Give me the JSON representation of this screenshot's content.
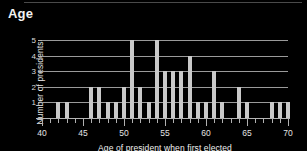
{
  "chart_data": {
    "type": "bar",
    "title": "Age",
    "subtitle": "",
    "xlabel": "Age of president when first elected",
    "ylabel": "Number of presidents",
    "xlim": [
      40,
      70
    ],
    "ylim": [
      0,
      5
    ],
    "grid": true,
    "legend_position": "none",
    "x_tick_labels": [
      "40",
      "45",
      "50",
      "55",
      "60",
      "65",
      "70"
    ],
    "x_major_ticks": [
      40,
      45,
      50,
      55,
      60,
      65,
      70
    ],
    "y_tick_labels": [
      "1",
      "2",
      "3",
      "4",
      "5"
    ],
    "y_ticks": [
      1,
      2,
      3,
      4,
      5
    ],
    "bar_color": "#c9c9c9",
    "background_color": "#000000",
    "text_color": "#e8e8e8",
    "grid_color": "#9a9a9a",
    "categories": [
      40,
      41,
      42,
      43,
      44,
      45,
      46,
      47,
      48,
      49,
      50,
      51,
      52,
      53,
      54,
      55,
      56,
      57,
      58,
      59,
      60,
      61,
      62,
      63,
      64,
      65,
      66,
      67,
      68,
      69,
      70
    ],
    "values": [
      0,
      0,
      1,
      1,
      0,
      0,
      2,
      2,
      1,
      1,
      2,
      5,
      2,
      1,
      5,
      3,
      3,
      3,
      4,
      1,
      1,
      3,
      1,
      0,
      2,
      1,
      0,
      0,
      1,
      1,
      1
    ]
  },
  "axis": {
    "x_title": "Age of president when first elected",
    "y_title": "Number of presidents"
  }
}
